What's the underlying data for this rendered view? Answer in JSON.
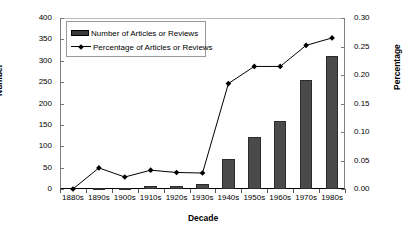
{
  "chart_data": {
    "type": "bar",
    "title": "",
    "xlabel": "Decade",
    "ylabel": "Number",
    "y2label": "Percentage",
    "categories": [
      "1880s",
      "1890s",
      "1900s",
      "1910s",
      "1920s",
      "1930s",
      "1940s",
      "1950s",
      "1960s",
      "1970s",
      "1980s"
    ],
    "ylim": [
      0,
      400
    ],
    "y2lim": [
      0,
      0.3
    ],
    "yticks": [
      "0",
      "50",
      "100",
      "150",
      "200",
      "250",
      "300",
      "350",
      "400"
    ],
    "ytick_values": [
      0,
      50,
      100,
      150,
      200,
      250,
      300,
      350,
      400
    ],
    "y2ticks": [
      "0.00",
      "0.05",
      "0.10",
      "0.15",
      "0.20",
      "0.25",
      "0.30"
    ],
    "y2tick_values": [
      0,
      0.05,
      0.1,
      0.15,
      0.2,
      0.25,
      0.3
    ],
    "grid": false,
    "legend_position": "top-left",
    "series": [
      {
        "name": "Number of Articles or Reviews",
        "kind": "bar",
        "axis": "left",
        "color": "#4a4a4a",
        "values": [
          0,
          3,
          3,
          6,
          6,
          12,
          70,
          122,
          158,
          255,
          312
        ]
      },
      {
        "name": "Percentage of Articles or Reviews",
        "kind": "line",
        "axis": "right",
        "color": "#000000",
        "marker": "diamond",
        "values": [
          0.0,
          0.037,
          0.021,
          0.033,
          0.029,
          0.028,
          0.185,
          0.215,
          0.215,
          0.252,
          0.265
        ]
      }
    ]
  },
  "legend": {
    "items": [
      {
        "label": "Number of Articles or Reviews",
        "swatch": "bar-swatch"
      },
      {
        "label": "Percentage of Articles or Reviews",
        "swatch": "line-swatch"
      }
    ]
  },
  "caption": {
    "text": ""
  }
}
